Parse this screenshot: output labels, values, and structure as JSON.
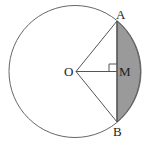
{
  "diagram": {
    "labels": {
      "center": "O",
      "top_point": "A",
      "bottom_point": "B",
      "midpoint": "M"
    },
    "colors": {
      "stroke": "#555555",
      "segment_fill": "#9a9a9a",
      "label": "#222222"
    }
  }
}
